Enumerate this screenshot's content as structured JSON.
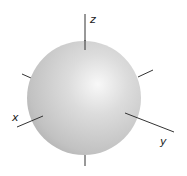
{
  "diagram": {
    "title": "",
    "shape": "sphere",
    "sphere": {
      "cx": 84,
      "cy": 98,
      "r": 57,
      "color_light": "#f7f7f7",
      "color_mid": "#c9c9c9",
      "color_dark": "#a9a9a9"
    },
    "axes": [
      {
        "name": "z",
        "label": "z"
      },
      {
        "name": "x",
        "label": "x"
      },
      {
        "name": "y",
        "label": "y"
      }
    ],
    "axis_color": "#333333"
  }
}
